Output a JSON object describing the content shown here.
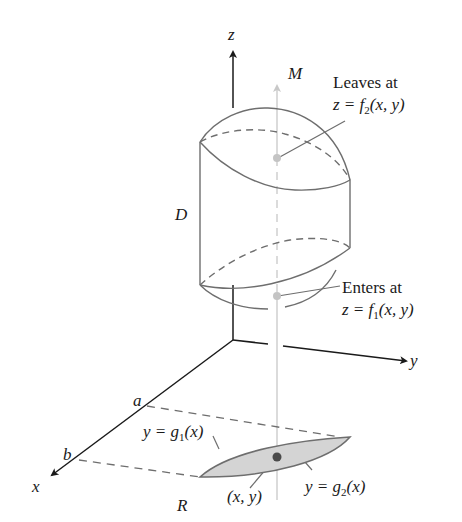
{
  "figure": {
    "type": "3d-region-diagram",
    "axes": {
      "x_label": "x",
      "y_label": "y",
      "z_label": "z"
    },
    "labels": {
      "solid": "D",
      "line": "M",
      "region": "R",
      "bound_a": "a",
      "bound_b": "b",
      "point": "(x, y)"
    },
    "leaves": {
      "line1": "Leaves at",
      "eq_prefix": "z = f",
      "eq_sub": "2",
      "eq_suffix": "(x, y)"
    },
    "enters": {
      "line1": "Enters at",
      "eq_prefix": "z = f",
      "eq_sub": "1",
      "eq_suffix": "(x, y)"
    },
    "g1": {
      "prefix": "y = g",
      "sub": "1",
      "suffix": "(x)"
    },
    "g2": {
      "prefix": "y = g",
      "sub": "2",
      "suffix": "(x)"
    },
    "colors": {
      "ink": "#1a1a1a",
      "surface_line": "#6e6e6e",
      "line_M": "#c8c8c8",
      "region_fill": "#d4d4d4",
      "point_dot_light": "#c4c4c4",
      "point_dot_dark": "#4a4a4a"
    }
  }
}
